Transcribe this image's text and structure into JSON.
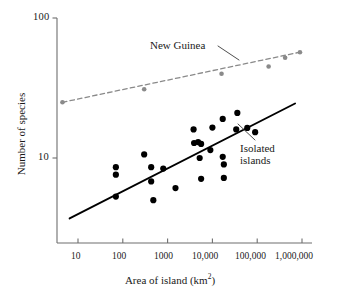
{
  "chart_data": {
    "type": "scatter",
    "title": "",
    "xlabel": "Area of island (km2)",
    "xlabel_base": "Area of island (km",
    "xlabel_sup": "2",
    "xlabel_tail": ")",
    "ylabel": "Number of species",
    "xscale": "log",
    "yscale": "log",
    "xlim": [
      4,
      2000000
    ],
    "ylim": [
      3.2,
      100
    ],
    "grid": false,
    "legend_position": "inline-annotations",
    "xticks": [
      10,
      100,
      1000,
      10000,
      100000,
      1000000
    ],
    "xticklabels": [
      "10",
      "100",
      "1000",
      "10,000",
      "100,000",
      "1,000,000"
    ],
    "yticks": [
      10,
      100
    ],
    "yticklabels": [
      "10",
      "100"
    ],
    "series": [
      {
        "name": "New Guinea",
        "annotation": "New Guinea",
        "color": "#8a8a8a",
        "marker": "circle",
        "linestyle": "dashed",
        "points": [
          {
            "x": 4.5,
            "y": 25
          },
          {
            "x": 300,
            "y": 31
          },
          {
            "x": 16000,
            "y": 40
          },
          {
            "x": 180000,
            "y": 45
          },
          {
            "x": 420000,
            "y": 52
          },
          {
            "x": 900000,
            "y": 57
          }
        ],
        "trendline": [
          {
            "x": 4.5,
            "y": 25
          },
          {
            "x": 900000,
            "y": 57
          }
        ]
      },
      {
        "name": "Isolated islands",
        "annotation": "Isolated islands",
        "annotation_line1": "Isolated",
        "annotation_line2": "islands",
        "color": "#000000",
        "marker": "circle",
        "linestyle": "solid",
        "points": [
          {
            "x": 70,
            "y": 8.6
          },
          {
            "x": 70,
            "y": 7.6
          },
          {
            "x": 70,
            "y": 5.3
          },
          {
            "x": 300,
            "y": 10.6
          },
          {
            "x": 430,
            "y": 8.6
          },
          {
            "x": 430,
            "y": 6.8
          },
          {
            "x": 480,
            "y": 5.0
          },
          {
            "x": 800,
            "y": 8.4
          },
          {
            "x": 1500,
            "y": 6.1
          },
          {
            "x": 3800,
            "y": 16.0
          },
          {
            "x": 3900,
            "y": 12.8
          },
          {
            "x": 4800,
            "y": 13.0
          },
          {
            "x": 5600,
            "y": 12.6
          },
          {
            "x": 5200,
            "y": 10.0
          },
          {
            "x": 5600,
            "y": 7.1
          },
          {
            "x": 10000,
            "y": 16.5
          },
          {
            "x": 9000,
            "y": 11.4
          },
          {
            "x": 17000,
            "y": 19.0
          },
          {
            "x": 17000,
            "y": 10.2
          },
          {
            "x": 18000,
            "y": 9.0
          },
          {
            "x": 18000,
            "y": 7.2
          },
          {
            "x": 36000,
            "y": 21.0
          },
          {
            "x": 34000,
            "y": 16.0
          },
          {
            "x": 60000,
            "y": 16.4
          },
          {
            "x": 90000,
            "y": 15.3
          }
        ],
        "trendline": [
          {
            "x": 6.5,
            "y": 3.7
          },
          {
            "x": 700000,
            "y": 24.5
          }
        ]
      }
    ]
  },
  "axes": {
    "y_title": "Number of species",
    "x_title_main": "Area of island (km",
    "x_title_sup": "2",
    "x_title_end": ")",
    "y_tick_top": "100",
    "y_tick_mid": "10",
    "x_tick_1": "10",
    "x_tick_2": "100",
    "x_tick_3": "1000",
    "x_tick_4": "10,000",
    "x_tick_5": "100,000",
    "x_tick_6": "1,000,000"
  },
  "annotations": {
    "new_guinea": "New Guinea",
    "isolated_line1": "Isolated",
    "isolated_line2": "islands"
  },
  "colors": {
    "new_guinea": "#8a8a8a",
    "isolated": "#000000",
    "axis": "#6e6e6e",
    "background": "#ffffff"
  }
}
